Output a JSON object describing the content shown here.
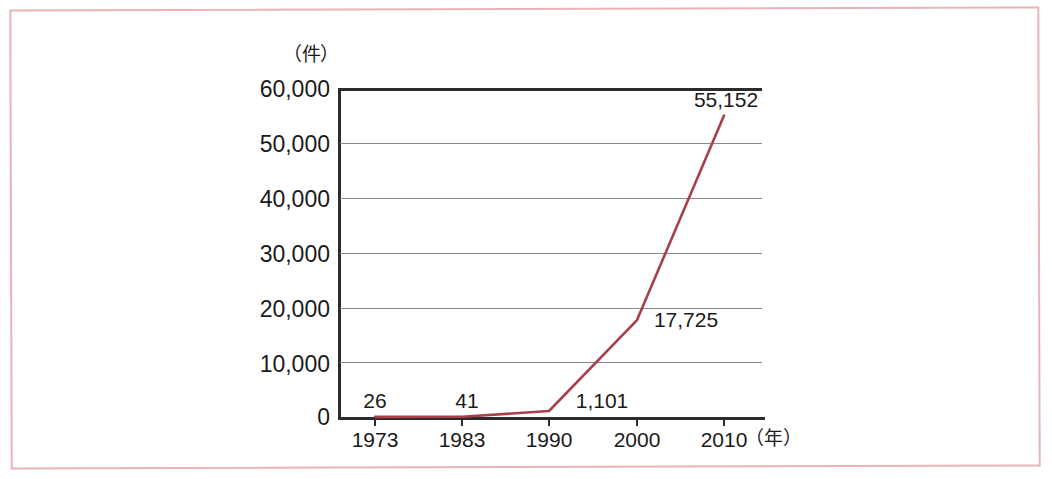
{
  "figure": {
    "y_axis_unit": "（件）",
    "x_axis_unit": "（年）",
    "line_color": "#a8404c",
    "axis_color": "#2b2b2b",
    "grid_color": "#8a8a8a",
    "frame_color": "#e8b4b8"
  },
  "chart_data": {
    "type": "line",
    "title": "",
    "subtitle": "",
    "xlabel": "（年）",
    "ylabel": "（件）",
    "categories": [
      "1973",
      "1983",
      "1990",
      "2000",
      "2010"
    ],
    "x": [
      1973,
      1983,
      1990,
      2000,
      2010
    ],
    "values": [
      26,
      41,
      1101,
      17725,
      55152
    ],
    "value_labels": [
      "26",
      "41",
      "1,101",
      "17,725",
      "55,152"
    ],
    "series": [
      {
        "name": "",
        "values": [
          26,
          41,
          1101,
          17725,
          55152
        ]
      }
    ],
    "ylim": [
      0,
      60000
    ],
    "ytick_labels": [
      "60,000",
      "50,000",
      "40,000",
      "30,000",
      "20,000",
      "10,000",
      "0"
    ],
    "ytick_values": [
      60000,
      50000,
      40000,
      30000,
      20000,
      10000,
      0
    ],
    "xtick_labels": [
      "1973",
      "1983",
      "1990",
      "2000",
      "2010"
    ],
    "grid": "horizontal",
    "legend": "none",
    "markers": "none"
  }
}
